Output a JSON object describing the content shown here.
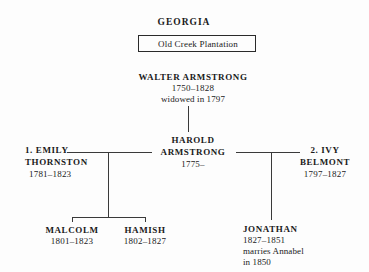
{
  "diagram": {
    "title": "GEORGIA",
    "estate": {
      "label": "Old Creek Plantation"
    },
    "generation1": {
      "name": "WALTER ARMSTRONG",
      "years": "1750–1828",
      "note": "widowed in 1797"
    },
    "generation2": {
      "center": {
        "name_line1": "HAROLD",
        "name_line2": "ARMSTRONG",
        "years": "1775–"
      },
      "spouse1": {
        "name_line1": "1. EMILY",
        "name_line2": "THORNSTON",
        "years": "1781–1823"
      },
      "spouse2": {
        "name_line1": "2. IVY",
        "name_line2": "BELMONT",
        "years": "1797–1827"
      }
    },
    "generation3": {
      "child1": {
        "name": "MALCOLM",
        "years": "1801–1823"
      },
      "child2": {
        "name": "HAMISH",
        "years": "1802–1827"
      },
      "child3": {
        "name": "JONATHAN",
        "years": "1827–1851",
        "note_line1": "marries Annabel",
        "note_line2": "in 1850"
      }
    }
  },
  "colors": {
    "background": "#fdfdfd",
    "text": "#1a1a1a",
    "line": "#3a3a3a",
    "box_border": "#2a2a2a"
  }
}
